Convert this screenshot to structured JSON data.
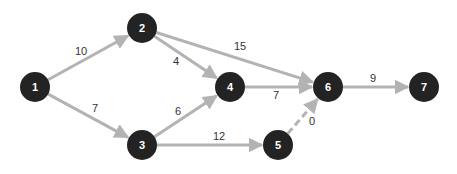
{
  "diagram": {
    "type": "network",
    "edge_color": "#b3b3b3",
    "node_color": "#232323",
    "node_text_color": "#ffffff",
    "label_color": "#333333",
    "nodes": [
      {
        "id": "1",
        "label": "1",
        "x": 35,
        "y": 87
      },
      {
        "id": "2",
        "label": "2",
        "x": 142,
        "y": 28
      },
      {
        "id": "3",
        "label": "3",
        "x": 142,
        "y": 145
      },
      {
        "id": "4",
        "label": "4",
        "x": 230,
        "y": 87
      },
      {
        "id": "5",
        "label": "5",
        "x": 278,
        "y": 145
      },
      {
        "id": "6",
        "label": "6",
        "x": 328,
        "y": 87
      },
      {
        "id": "7",
        "label": "7",
        "x": 424,
        "y": 87
      }
    ],
    "edges": [
      {
        "from": "1",
        "to": "2",
        "label": "10",
        "dashed": false,
        "lx": 81,
        "ly": 51
      },
      {
        "from": "1",
        "to": "3",
        "label": "7",
        "dashed": false,
        "lx": 95,
        "ly": 108
      },
      {
        "from": "2",
        "to": "4",
        "label": "4",
        "dashed": false,
        "lx": 176,
        "ly": 61
      },
      {
        "from": "2",
        "to": "6",
        "label": "15",
        "dashed": false,
        "lx": 240,
        "ly": 46
      },
      {
        "from": "3",
        "to": "4",
        "label": "6",
        "dashed": false,
        "lx": 178,
        "ly": 111
      },
      {
        "from": "3",
        "to": "5",
        "label": "12",
        "dashed": false,
        "lx": 219,
        "ly": 136
      },
      {
        "from": "4",
        "to": "6",
        "label": "7",
        "dashed": false,
        "lx": 276,
        "ly": 95
      },
      {
        "from": "5",
        "to": "6",
        "label": "0",
        "dashed": true,
        "lx": 312,
        "ly": 121
      },
      {
        "from": "6",
        "to": "7",
        "label": "9",
        "dashed": false,
        "lx": 373,
        "ly": 78
      }
    ]
  }
}
